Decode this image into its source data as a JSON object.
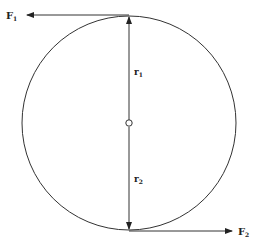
{
  "diagram": {
    "type": "force couple on circle",
    "circle": {
      "cx": 129,
      "cy": 123,
      "r": 107
    },
    "labels": {
      "F1": {
        "main": "F",
        "sub": "1"
      },
      "F2": {
        "main": "F",
        "sub": "2"
      },
      "r1": {
        "main": "r",
        "sub": "1"
      },
      "r2": {
        "main": "r",
        "sub": "2"
      }
    },
    "colors": {
      "stroke": "#333333",
      "background": "#ffffff"
    }
  }
}
